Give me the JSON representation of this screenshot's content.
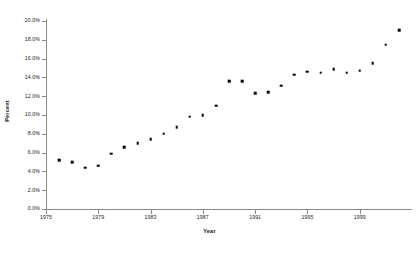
{
  "chart_data": {
    "type": "scatter",
    "title": "",
    "xlabel": "Year",
    "ylabel": "Percent",
    "xlim": [
      1975,
      2003
    ],
    "ylim": [
      0,
      20
    ],
    "grid": false,
    "legend": null,
    "y_tick_labels": [
      "20.0%",
      "18.0%",
      "16.0%",
      "14.0%",
      "12.0%",
      "10.0%",
      "8.0%",
      "6.0%",
      "4.0%",
      "2.0%",
      "0.0%"
    ],
    "y_tick_values": [
      20,
      18,
      16,
      14,
      12,
      10,
      8,
      6,
      4,
      2,
      0
    ],
    "x_tick_labels": [
      "1975",
      "1979",
      "1983",
      "1987",
      "1991",
      "1995",
      "1999"
    ],
    "x_tick_values": [
      1975,
      1979,
      1983,
      1987,
      1991,
      1995,
      1999
    ],
    "marker": "square",
    "marker_color": "#000000",
    "axis_color": "#8a8a8a",
    "background_color": "#ffffff",
    "x": [
      1976,
      1977,
      1978,
      1979,
      1980,
      1981,
      1982,
      1983,
      1984,
      1985,
      1986,
      1987,
      1988,
      1989,
      1990,
      1991,
      1992,
      1993,
      1994,
      1995,
      1996,
      1997,
      1998,
      1999,
      2000,
      2001,
      2002
    ],
    "values": [
      5.2,
      5.0,
      4.4,
      4.6,
      5.9,
      6.6,
      7.0,
      7.4,
      8.0,
      8.7,
      9.8,
      10.0,
      11.0,
      13.6,
      13.6,
      12.3,
      12.4,
      13.1,
      14.3,
      14.6,
      14.5,
      14.9,
      14.5,
      14.7,
      15.5,
      17.5,
      19.0
    ]
  }
}
